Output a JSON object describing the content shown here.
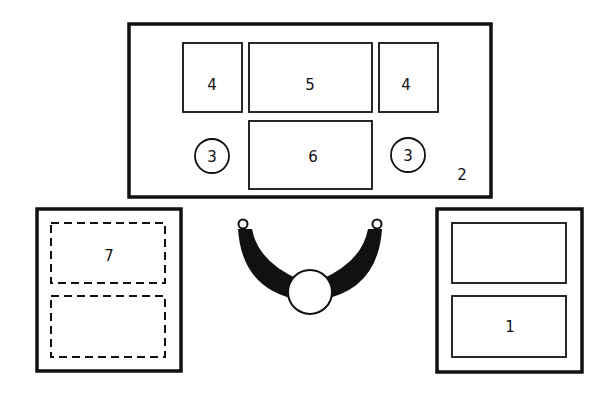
{
  "diagram": {
    "colors": {
      "ink": "#111111",
      "background": "#ffffff"
    },
    "main_panel": {
      "label": "2",
      "top_boxes": [
        {
          "label": "4",
          "position": "left"
        },
        {
          "label": "5",
          "position": "center"
        },
        {
          "label": "4",
          "position": "right"
        }
      ],
      "center_box": {
        "label": "6"
      },
      "circles": [
        {
          "label": "3",
          "position": "left"
        },
        {
          "label": "3",
          "position": "right"
        }
      ]
    },
    "left_panel": {
      "style": "dashed-inner",
      "boxes": [
        {
          "label": "7"
        },
        {
          "label": ""
        }
      ]
    },
    "right_panel": {
      "style": "solid-inner",
      "boxes": [
        {
          "label": ""
        },
        {
          "label": "1"
        }
      ]
    },
    "yoke": {
      "shape": "u-shaped-crescent-with-circle",
      "label": ""
    }
  }
}
